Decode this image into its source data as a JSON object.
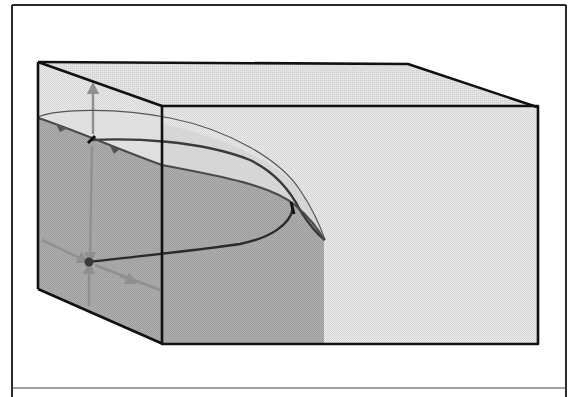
{
  "figure": {
    "type": "3d-box-diagram",
    "colors": {
      "frame": "#2a2a2a",
      "box_edge": "#111111",
      "face_light": "#e6e6e6",
      "face_top": "#dcdcdc",
      "shaded_region": "#a9a9a9",
      "trajectory": "#333333",
      "axis_gray": "#8f8f8f",
      "band_light": "#d2d2d2"
    },
    "box": {
      "back_top_left": [
        38,
        62
      ],
      "back_top_right": [
        408,
        64
      ],
      "front_top_left": [
        162,
        106
      ],
      "front_top_right": [
        537,
        107
      ],
      "front_bottom_left": [
        163,
        344
      ],
      "front_bottom_right": [
        538,
        343
      ],
      "back_bottom_left": [
        38,
        289
      ]
    },
    "points": [
      {
        "name": "upper-fixed-point",
        "x": 91,
        "y": 140
      },
      {
        "name": "lower-fixed-point",
        "x": 89,
        "y": 262
      }
    ],
    "caption": ""
  }
}
